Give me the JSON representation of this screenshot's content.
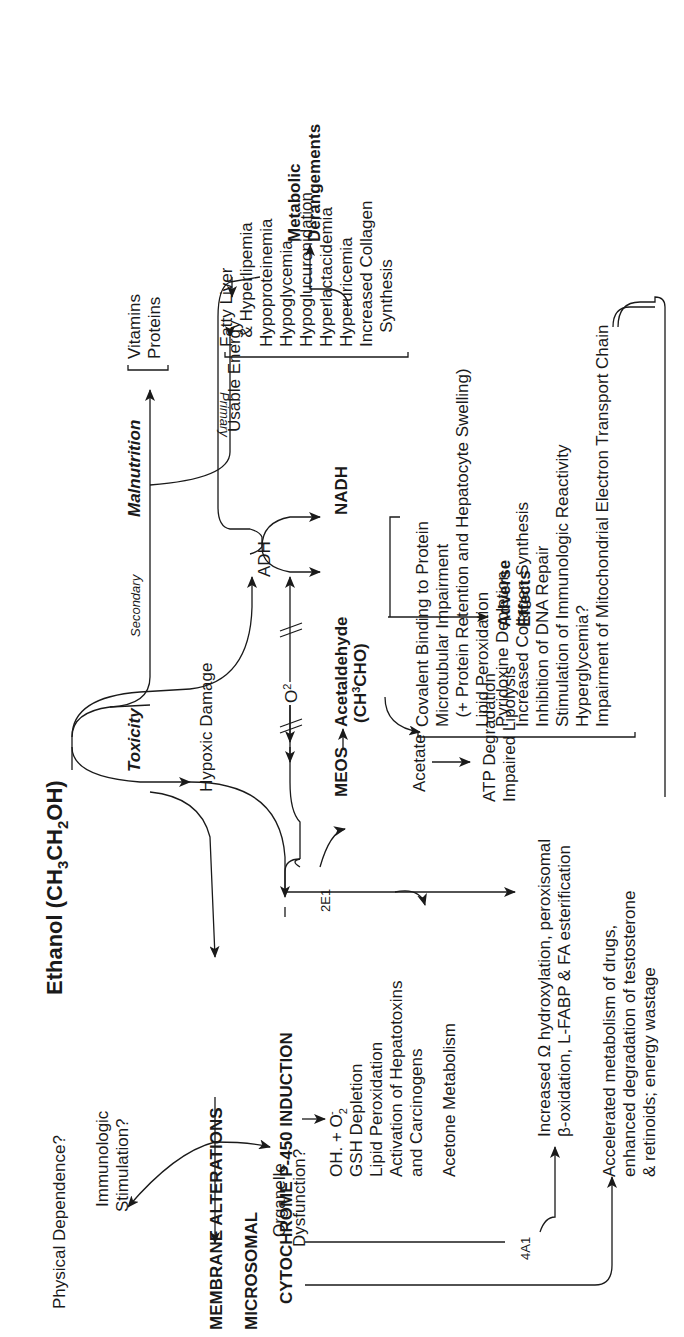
{
  "title": "Ethanol (CH3CH2OH)",
  "title_parts": {
    "a": "Ethanol (CH",
    "sub1": "3",
    "b": "CH",
    "sub2": "2",
    "c": "OH)"
  },
  "branches": {
    "toxicity": "Toxicity",
    "malnutrition": "Malnutrition",
    "secondary": "Secondary",
    "primary": "Primary",
    "usable_energy": "Usable Energy",
    "hypoxic_damage": "Hypoxic Damage",
    "o2": "O2",
    "adh": "ADH",
    "nadh": "NADH",
    "meos": "MEOS",
    "acetaldehyde": "Acetaldehyde",
    "acetaldehyde_formula": "(CH3CHO)",
    "acetate": "Acetate",
    "adverse_effects": [
      "Adverse",
      "Effects"
    ],
    "metabolic_derangements": [
      "Metabolic",
      "Derangements"
    ],
    "cyp_2e1": "2E1",
    "cyp_4a1": "4A1"
  },
  "malnutrition_items": [
    "Vitamins",
    "Proteins"
  ],
  "metabolic_items": [
    "Fatty Liver",
    "  & Hyperlipemia",
    "Hypoproteinemia",
    "Hypoglycemia",
    "Hypoglucuronidation",
    "Hyperlactacidemia",
    "Hyperuricemia",
    "Increased Collagen",
    "   Synthesis"
  ],
  "adverse_items": [
    "Covalent Binding to Protein",
    "Microtubular Impairment",
    "  (+ Protein Retention and Hepatocyte Swelling)",
    "Lipid Peroxidation",
    "Pyridoxine Depletion",
    "Increased Collagen Synthesis",
    "Inhibition of DNA Repair",
    "Stimulation of Immunologic Reactivity",
    "Hyperglycemia?",
    "Impairment of Mitochondrial Electron Transport Chain"
  ],
  "acetate_effects": [
    "ATP Degradation",
    "Impaired Lipolysis"
  ],
  "membrane": {
    "label": "MEMBRANE ALTERATIONS",
    "physical_dependence": "Physical Dependence?",
    "immunologic": [
      "Immunologic",
      "Stimulation?"
    ],
    "organelle": [
      "Organelle",
      "Dysfunction?"
    ]
  },
  "microsomal": {
    "label1": "MICROSOMAL",
    "label2": "CYTOCHROME P-450 INDUCTION",
    "effects": [
      "OH. + O2̄",
      "GSH Depletion",
      "Lipid Peroxidation",
      "Activation of Hepatotoxins",
      "and Carcinogens"
    ],
    "acetone": "Acetone Metabolism",
    "hydroxylation": [
      "Increased Ω hydroxylation, peroxisomal",
      "β-oxidation, L-FABP & FA esterification"
    ],
    "accelerated": [
      "Accelerated metabolism of drugs,",
      "enhanced degradation of testosterone",
      "& retinoids; energy wastage"
    ]
  }
}
